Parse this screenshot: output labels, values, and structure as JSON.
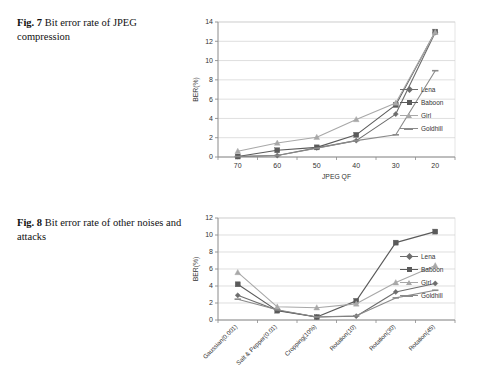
{
  "page": {
    "background": "#ffffff"
  },
  "figures": [
    {
      "id": "fig7",
      "caption_label": "Fig. 7",
      "caption_text": "Bit error rate of JPEG compression",
      "chart_data": {
        "type": "line",
        "title": "",
        "xlabel": "JPEG QF",
        "ylabel": "BER(%)",
        "categories": [
          "70",
          "60",
          "50",
          "40",
          "30",
          "20"
        ],
        "ylim": [
          0,
          14
        ],
        "yticks": [
          0,
          2,
          4,
          6,
          8,
          10,
          12,
          14
        ],
        "grid": "horizontal",
        "legend_position": "right",
        "series": [
          {
            "name": "Lena",
            "marker": "diamond",
            "color": "#6d6d6d",
            "values": [
              0.05,
              0.15,
              0.95,
              1.7,
              4.45,
              12.9
            ]
          },
          {
            "name": "Baboon",
            "marker": "square",
            "color": "#5a5a5a",
            "values": [
              0.05,
              0.7,
              1.0,
              2.3,
              5.4,
              13.0
            ]
          },
          {
            "name": "Girl",
            "marker": "triangle",
            "color": "#a8a8a8",
            "values": [
              0.6,
              1.45,
              2.05,
              3.9,
              5.6,
              12.95
            ]
          },
          {
            "name": "Goldhill",
            "marker": "dash",
            "color": "#8a8a8a",
            "values": [
              0.05,
              0.15,
              0.9,
              1.7,
              2.3,
              8.95
            ]
          }
        ]
      }
    },
    {
      "id": "fig8",
      "caption_label": "Fig. 8",
      "caption_text": "Bit error rate of other noises and attacks",
      "chart_data": {
        "type": "line",
        "title": "",
        "xlabel": "",
        "ylabel": "BER(%)",
        "categories": [
          "Gaussian(0.001)",
          "Salt & Pepper(0.01)",
          "Cropping(10%)",
          "Rotation(10)",
          "Rotation(30)",
          "Rotation(45)"
        ],
        "ylim": [
          0,
          12
        ],
        "yticks": [
          0,
          2,
          4,
          6,
          8,
          10,
          12
        ],
        "grid": "horizontal",
        "legend_position": "right",
        "series": [
          {
            "name": "Lena",
            "marker": "diamond",
            "color": "#6d6d6d",
            "values": [
              2.9,
              1.15,
              0.35,
              0.45,
              3.3,
              4.3
            ]
          },
          {
            "name": "Baboon",
            "marker": "square",
            "color": "#5a5a5a",
            "values": [
              4.2,
              1.1,
              0.35,
              2.25,
              9.1,
              10.4
            ]
          },
          {
            "name": "Girl",
            "marker": "triangle",
            "color": "#a8a8a8",
            "values": [
              5.6,
              1.55,
              1.45,
              1.9,
              4.4,
              6.4
            ]
          },
          {
            "name": "Goldhill",
            "marker": "dash",
            "color": "#8a8a8a",
            "values": [
              2.45,
              1.2,
              0.35,
              0.5,
              2.6,
              3.5
            ]
          }
        ]
      }
    }
  ],
  "legend": {
    "items": [
      {
        "label": "Lena",
        "marker": "diamond",
        "color": "#6d6d6d"
      },
      {
        "label": "Baboon",
        "marker": "square",
        "color": "#5a5a5a"
      },
      {
        "label": "Girl",
        "marker": "triangle",
        "color": "#a8a8a8"
      },
      {
        "label": "Goldhill",
        "marker": "dash",
        "color": "#8a8a8a"
      }
    ]
  }
}
